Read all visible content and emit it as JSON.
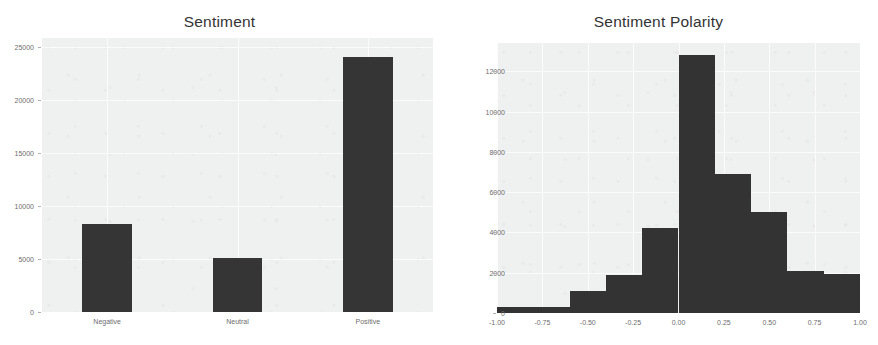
{
  "figure": {
    "width": 878,
    "height": 345,
    "background": "#ffffff",
    "panel_background": "#eff0f0",
    "grid_color": "#fbfbfb",
    "bar_color": "#353535",
    "tick_label_color": "#6d6d6d",
    "title_color": "#333333"
  },
  "chart_data": [
    {
      "type": "bar",
      "title": "Sentiment",
      "xlabel": "",
      "ylabel": "",
      "categories": [
        "Negative",
        "Neutral",
        "Positive"
      ],
      "values": [
        8300,
        5100,
        24000
      ],
      "ylim": [
        0,
        25800
      ],
      "yticks": [
        0,
        5000,
        10000,
        15000,
        20000,
        25000
      ],
      "ytick_labels": [
        "0",
        "5000",
        "10000",
        "15000",
        "20000",
        "25000"
      ],
      "xtick_labels": [
        "Negative",
        "Neutral",
        "Positive"
      ],
      "grid": true,
      "legend": "none"
    },
    {
      "type": "bar",
      "subtype": "histogram",
      "title": "Sentiment Polarity",
      "xlabel": "",
      "ylabel": "",
      "bin_edges": [
        -1.0,
        -0.8,
        -0.6,
        -0.4,
        -0.2,
        0.0,
        0.2,
        0.4,
        0.6,
        0.8,
        1.0
      ],
      "categories": [
        "-1.0 to -0.8",
        "-0.8 to -0.6",
        "-0.6 to -0.4",
        "-0.4 to -0.2",
        "-0.2 to 0.0",
        "0.0 to 0.2",
        "0.2 to 0.4",
        "0.4 to 0.6",
        "0.6 to 0.8",
        "0.8 to 1.0"
      ],
      "values": [
        300,
        300,
        1100,
        1900,
        4200,
        12800,
        6900,
        5000,
        2100,
        1950
      ],
      "xlim": [
        -1.0,
        1.0
      ],
      "ylim": [
        0,
        13400
      ],
      "yticks": [
        0,
        2000,
        4000,
        6000,
        8000,
        10000,
        12000
      ],
      "ytick_labels": [
        "0",
        "2000",
        "4000",
        "6000",
        "8000",
        "10000",
        "12000"
      ],
      "xticks": [
        -1.0,
        -0.75,
        -0.5,
        -0.25,
        0.0,
        0.25,
        0.5,
        0.75,
        1.0
      ],
      "xtick_labels": [
        "-1.00",
        "-0.75",
        "-0.50",
        "-0.25",
        "0.00",
        "0.25",
        "0.50",
        "0.75",
        "1.00"
      ],
      "grid": true,
      "legend": "none"
    }
  ]
}
